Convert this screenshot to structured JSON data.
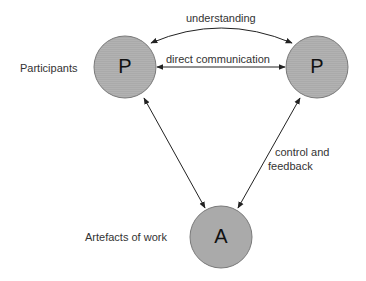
{
  "diagram": {
    "nodes": [
      {
        "id": "p1",
        "letter": "P",
        "label": "Participants"
      },
      {
        "id": "p2",
        "letter": "P",
        "label": ""
      },
      {
        "id": "a",
        "letter": "A",
        "label": "Artefacts of work"
      }
    ],
    "edges": [
      {
        "from": "p1",
        "to": "p2",
        "label": "understanding",
        "style": "curved",
        "bidirectional": true
      },
      {
        "from": "p1",
        "to": "p2",
        "label": "direct communication",
        "style": "straight",
        "bidirectional": true
      },
      {
        "from": "p1",
        "to": "a",
        "label": "",
        "style": "straight",
        "bidirectional": true
      },
      {
        "from": "p2",
        "to": "a",
        "label": "control and feedback",
        "style": "straight",
        "bidirectional": true
      }
    ],
    "labels": {
      "understanding": "understanding",
      "direct_communication": "direct communication",
      "control_line1": "control and",
      "control_line2": "feedback",
      "participants": "Participants",
      "artefacts": "Artefacts of work"
    },
    "colors": {
      "node_fill": "#a9a9a9",
      "node_stroke": "#777777",
      "arrow": "#222222"
    }
  }
}
